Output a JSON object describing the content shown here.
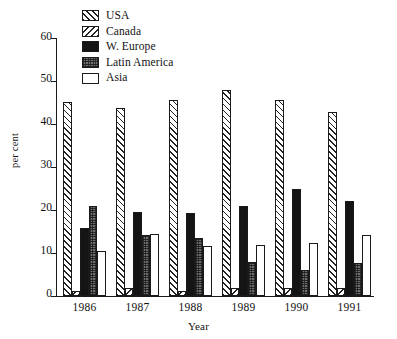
{
  "chart_data": {
    "type": "bar",
    "title": "",
    "xlabel": "Year",
    "ylabel": "per cent",
    "categories": [
      "1986",
      "1987",
      "1988",
      "1989",
      "1990",
      "1991"
    ],
    "ylim": [
      0,
      60
    ],
    "yticks": [
      0,
      10,
      20,
      30,
      40,
      50,
      60
    ],
    "grid": false,
    "legend_position": "top-center",
    "series": [
      {
        "name": "USA",
        "pattern": "diagonal-hatch-up",
        "values": [
          45.0,
          43.6,
          45.6,
          47.8,
          45.5,
          42.7
        ]
      },
      {
        "name": "Canada",
        "pattern": "diagonal-hatch-down",
        "values": [
          1.2,
          1.9,
          1.2,
          1.7,
          1.7,
          1.9
        ]
      },
      {
        "name": "W. Europe",
        "pattern": "solid-black",
        "values": [
          15.7,
          19.6,
          19.2,
          21.0,
          24.8,
          22.1
        ]
      },
      {
        "name": "Latin America",
        "pattern": "dark-gray-texture",
        "values": [
          21.0,
          14.2,
          13.5,
          7.8,
          6.1,
          7.7
        ]
      },
      {
        "name": "Asia",
        "pattern": "white-empty",
        "values": [
          10.3,
          14.4,
          11.6,
          11.9,
          12.3,
          14.1
        ]
      }
    ]
  },
  "legend": {
    "items": [
      {
        "label": "USA",
        "swatch": "usa-swatch"
      },
      {
        "label": "Canada",
        "swatch": "canada-swatch"
      },
      {
        "label": "W. Europe",
        "swatch": "weurope-swatch"
      },
      {
        "label": "Latin America",
        "swatch": "latam-swatch"
      },
      {
        "label": "Asia",
        "swatch": "asia-swatch"
      }
    ]
  },
  "colors": {
    "axis": "#1a1a1a",
    "usa": "#ffffff",
    "canada": "#ffffff",
    "weurope": "#141414",
    "latam": "#6f6f6f",
    "asia": "#ffffff",
    "background": "#ffffff"
  }
}
